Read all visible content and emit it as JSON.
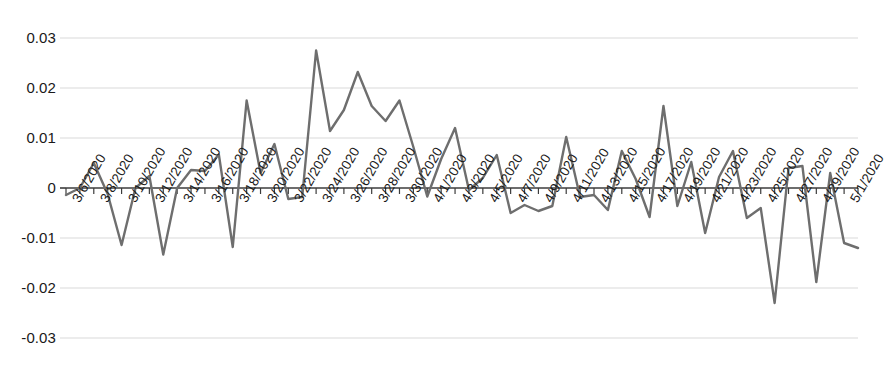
{
  "chart_data": {
    "type": "line",
    "title": "",
    "subtitle": "",
    "xlabel": "",
    "ylabel": "",
    "grid": true,
    "legend": false,
    "legend_position": "none",
    "line_color": "#6e6e6e",
    "gridline_color": "#d9d9d9",
    "axis_color": "#3c3c3c",
    "ylim": [
      -0.03,
      0.03
    ],
    "yticks": [
      0.03,
      0.02,
      0.01,
      0,
      -0.01,
      -0.02,
      -0.03
    ],
    "ytick_labels": [
      "0.03",
      "0.02",
      "0.01",
      "0",
      "-0.01",
      "-0.02",
      "-0.03"
    ],
    "xtick_labels": [
      "3/6/2020",
      "3/8/2020",
      "3/10/2020",
      "3/12/2020",
      "3/14/2020",
      "3/16/2020",
      "3/18/2020",
      "3/20/2020",
      "3/22/2020",
      "3/24/2020",
      "3/26/2020",
      "3/28/2020",
      "3/30/2020",
      "4/1/2020",
      "4/3/2020",
      "4/5/2020",
      "4/7/2020",
      "4/9/2020",
      "4/11/2020",
      "4/13/2020",
      "4/15/2020",
      "4/17/2020",
      "4/19/2020",
      "4/21/2020",
      "4/23/2020",
      "4/25/2020",
      "4/27/2020",
      "4/29/2020",
      "5/1/2020"
    ],
    "x": [
      "3/6/2020",
      "3/7/2020",
      "3/8/2020",
      "3/9/2020",
      "3/10/2020",
      "3/11/2020",
      "3/12/2020",
      "3/13/2020",
      "3/14/2020",
      "3/15/2020",
      "3/16/2020",
      "3/17/2020",
      "3/18/2020",
      "3/19/2020",
      "3/20/2020",
      "3/21/2020",
      "3/22/2020",
      "3/23/2020",
      "3/24/2020",
      "3/25/2020",
      "3/26/2020",
      "3/27/2020",
      "3/28/2020",
      "3/29/2020",
      "3/30/2020",
      "3/31/2020",
      "4/1/2020",
      "4/2/2020",
      "4/3/2020",
      "4/4/2020",
      "4/5/2020",
      "4/6/2020",
      "4/7/2020",
      "4/8/2020",
      "4/9/2020",
      "4/10/2020",
      "4/11/2020",
      "4/12/2020",
      "4/13/2020",
      "4/14/2020",
      "4/15/2020",
      "4/16/2020",
      "4/17/2020",
      "4/18/2020",
      "4/19/2020",
      "4/20/2020",
      "4/21/2020",
      "4/22/2020",
      "4/23/2020",
      "4/24/2020",
      "4/25/2020",
      "4/26/2020",
      "4/27/2020",
      "4/28/2020",
      "4/29/2020",
      "4/30/2020",
      "5/1/2020",
      "5/2/2020"
    ],
    "values": [
      -0.0014,
      0.0,
      0.005,
      -0.0012,
      -0.0114,
      0.0,
      0.0024,
      -0.0133,
      0.0,
      0.0036,
      0.0034,
      0.0067,
      -0.0118,
      0.0175,
      0.003,
      0.0088,
      -0.0022,
      -0.0018,
      0.0275,
      0.0114,
      0.0156,
      0.0232,
      0.0164,
      0.0134,
      0.0175,
      0.0082,
      -0.0017,
      0.0058,
      0.012,
      -0.0004,
      0.002,
      0.0066,
      -0.005,
      -0.0034,
      -0.0046,
      -0.0036,
      0.0102,
      -0.0018,
      -0.0014,
      -0.0044,
      0.0074,
      0.0018,
      -0.0058,
      0.0164,
      -0.0036,
      0.0052,
      -0.009,
      0.0022,
      0.0074,
      -0.006,
      -0.004,
      -0.023,
      0.004,
      0.0044,
      -0.0188,
      0.003,
      -0.011,
      -0.012
    ]
  }
}
